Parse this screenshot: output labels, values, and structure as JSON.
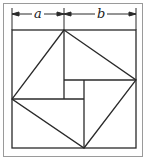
{
  "diagram": {
    "labels": {
      "a": "a",
      "b": "b"
    },
    "colors": {
      "stroke": "#2a2a2a",
      "frame": "#9a9a9a",
      "background": "#ffffff"
    },
    "outer_square": {
      "x": 12,
      "y": 30,
      "size": 124
    },
    "dimension_a": 52,
    "dimension_b": 72,
    "tilted_square_vertices": [
      [
        64,
        30
      ],
      [
        136,
        80
      ],
      [
        84,
        148
      ],
      [
        12,
        99
      ]
    ],
    "inner_square": {
      "x": 64,
      "y": 80,
      "width": 20,
      "height": 19
    }
  }
}
